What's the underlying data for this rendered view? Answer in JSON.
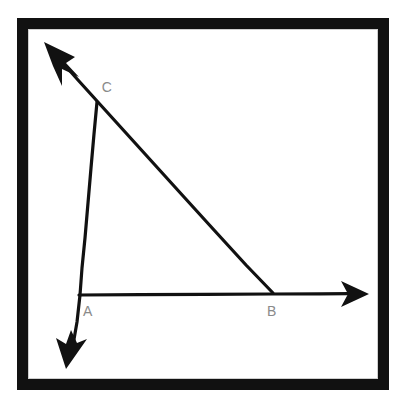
{
  "figure": {
    "title": "Geometric figure: triangle ABC formed by three rays",
    "background_color": "#ffffff",
    "ink_color": "#111111",
    "label_color": "#8a8a8a"
  },
  "frame": {
    "name": "decorative-border",
    "outer_margin_color": "#ffffff",
    "hairline_color": "#a8a8a8",
    "band_color": "#111111",
    "inner_fill_color": "#ffffff",
    "outer_margin_px": 18,
    "band_width_px": 11
  },
  "vertices": [
    {
      "id": "A",
      "label": "A",
      "x": 79,
      "y": 295,
      "label_x": 88,
      "label_y": 316,
      "description": "vertex where the vertical ray crosses the start of the horizontal ray"
    },
    {
      "id": "B",
      "label": "B",
      "x": 272,
      "y": 295,
      "label_x": 272,
      "label_y": 316,
      "description": "vertex where the diagonal ray crosses the horizontal ray"
    },
    {
      "id": "C",
      "label": "C",
      "x": 96,
      "y": 100,
      "label_x": 103,
      "label_y": 92,
      "description": "apex vertex where the vertical ray meets the diagonal ray"
    }
  ],
  "rays": [
    {
      "id": "ray-vertical",
      "name": "vertical-ray-through-C-and-A",
      "from": {
        "x": 97,
        "y": 101
      },
      "to": {
        "x": 70,
        "y": 357
      },
      "arrow_at": "end",
      "arrow_direction": "down",
      "passes_through": [
        "C",
        "A"
      ]
    },
    {
      "id": "ray-diagonal",
      "name": "diagonal-ray-through-B-and-C",
      "from": {
        "x": 273,
        "y": 294
      },
      "to": {
        "x": 48,
        "y": 47
      },
      "arrow_at": "end",
      "arrow_direction": "up-left",
      "passes_through": [
        "B",
        "C"
      ]
    },
    {
      "id": "ray-horizontal",
      "name": "horizontal-ray-from-A-through-B",
      "from": {
        "x": 79,
        "y": 295
      },
      "to": {
        "x": 363,
        "y": 294
      },
      "arrow_at": "end",
      "arrow_direction": "right",
      "passes_through": [
        "A",
        "B"
      ]
    }
  ],
  "segments": [
    {
      "id": "AC",
      "name": "segment-A-to-C",
      "endpoints": [
        "A",
        "C"
      ]
    },
    {
      "id": "AB",
      "name": "segment-A-to-B",
      "endpoints": [
        "A",
        "B"
      ]
    },
    {
      "id": "CB",
      "name": "segment-C-to-B",
      "endpoints": [
        "C",
        "B"
      ]
    }
  ]
}
